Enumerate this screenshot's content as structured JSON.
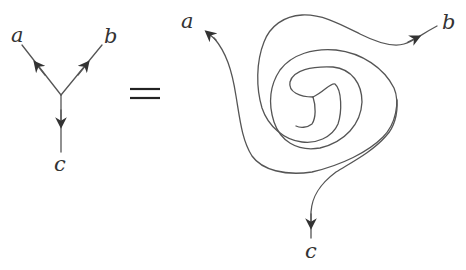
{
  "diagram": {
    "type": "trivalent-vertex-identity",
    "relation_symbol": "=",
    "left": {
      "description": "trivalent vertex with two outgoing edges (a, b) and one edge c, directed away from vertex toward a and b, toward c downward",
      "labels": {
        "a": "a",
        "b": "b",
        "c": "c"
      }
    },
    "right": {
      "description": "single strand spiraling around a central trivalent vertex, ends labeled a, b, c",
      "labels": {
        "a": "a",
        "b": "b",
        "c": "c"
      }
    },
    "colors": {
      "stroke": "#555555",
      "arrow": "#333333",
      "text": "#333333",
      "background": "#ffffff"
    }
  }
}
